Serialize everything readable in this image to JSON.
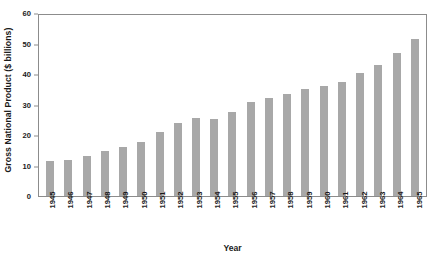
{
  "chart_data": {
    "type": "bar",
    "title": "",
    "xlabel": "Year",
    "ylabel": "Gross National Product ($ billions)",
    "categories": [
      "1945",
      "1946",
      "1947",
      "1948",
      "1949",
      "1950",
      "1951",
      "1952",
      "1953",
      "1954",
      "1955",
      "1956",
      "1957",
      "1958",
      "1959",
      "1960",
      "1961",
      "1962",
      "1963",
      "1964",
      "1965"
    ],
    "values": [
      11.5,
      11.8,
      13.0,
      14.8,
      16.2,
      17.8,
      21.0,
      24.0,
      25.5,
      25.2,
      27.5,
      30.8,
      32.0,
      33.3,
      35.0,
      36.2,
      37.5,
      40.2,
      43.0,
      46.8,
      51.5
    ],
    "ylim": [
      0,
      60
    ],
    "yticks": [
      0,
      10,
      20,
      30,
      40,
      50,
      60
    ],
    "grid": false,
    "legend": null,
    "bar_color": "#a8a8a8",
    "axis_color": "#8c8c8c"
  }
}
